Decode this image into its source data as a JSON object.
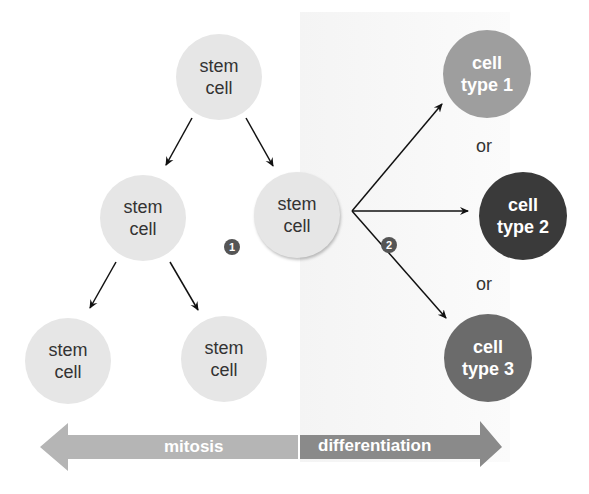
{
  "diagram": {
    "stem_cells": [
      {
        "line1": "stem",
        "line2": "cell"
      },
      {
        "line1": "stem",
        "line2": "cell"
      },
      {
        "line1": "stem",
        "line2": "cell"
      },
      {
        "line1": "stem",
        "line2": "cell"
      },
      {
        "line1": "stem",
        "line2": "cell"
      }
    ],
    "cell_types": [
      {
        "line1": "cell",
        "line2": "type 1",
        "color": "#9e9e9e"
      },
      {
        "line1": "cell",
        "line2": "type 2",
        "color": "#3a3a3a"
      },
      {
        "line1": "cell",
        "line2": "type 3",
        "color": "#6b6b6b"
      }
    ],
    "or_labels": [
      "or",
      "or"
    ],
    "badges": [
      "1",
      "2"
    ],
    "arrow_bar": {
      "left_label": "mitosis",
      "right_label": "differentiation",
      "left_color": "#b5b5b5",
      "right_color": "#8a8a8a"
    }
  }
}
